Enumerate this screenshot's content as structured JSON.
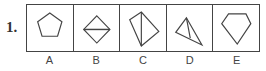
{
  "question": {
    "number": "1.",
    "options": [
      {
        "label": "A",
        "figure": "pentagon-icon"
      },
      {
        "label": "B",
        "figure": "diamond-with-horizontal-line-icon"
      },
      {
        "label": "C",
        "figure": "quadrilateral-with-diagonal-icon"
      },
      {
        "label": "D",
        "figure": "triangle-with-inner-line-icon"
      },
      {
        "label": "E",
        "figure": "gem-pentagon-icon"
      }
    ]
  },
  "colors": {
    "stroke": "#444444",
    "background": "#ffffff"
  }
}
